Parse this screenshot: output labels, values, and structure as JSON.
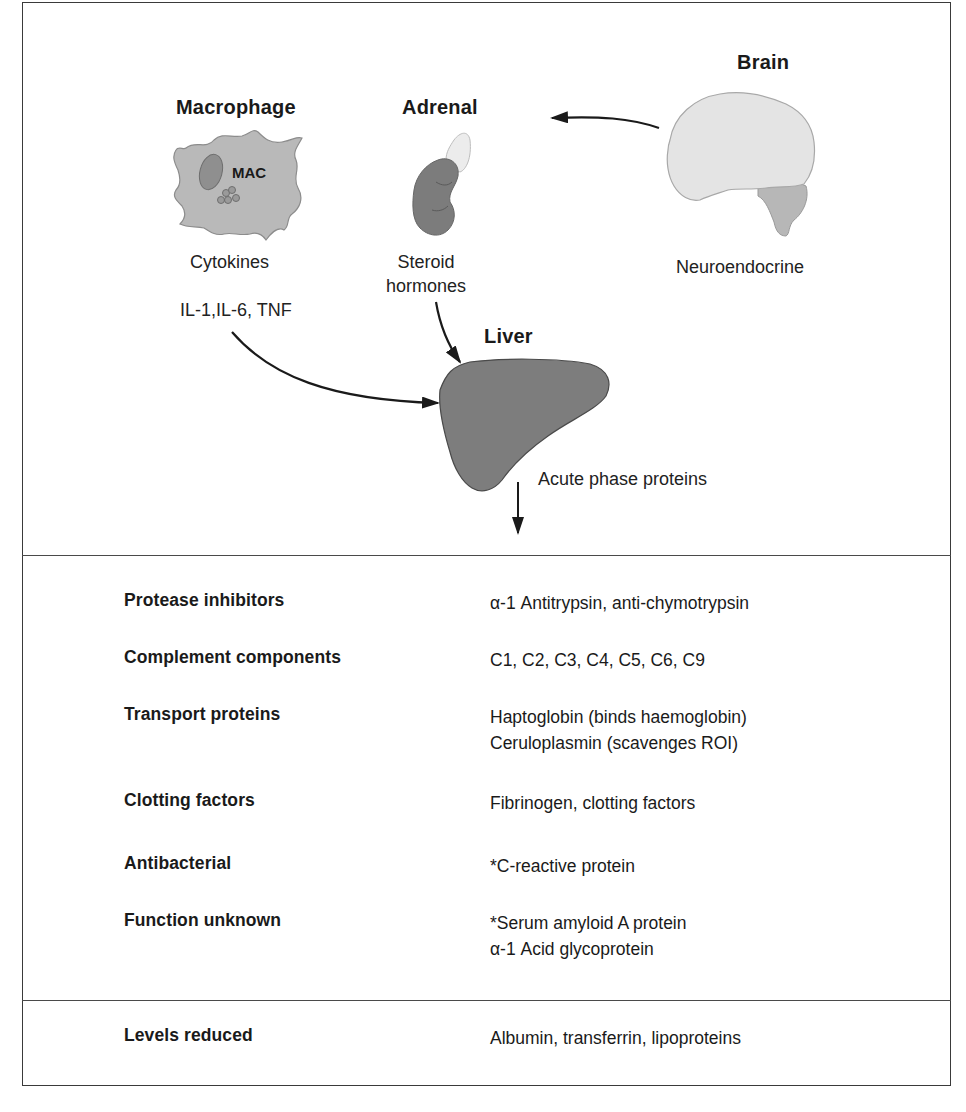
{
  "diagram": {
    "nodes": {
      "macrophage": {
        "title": "Macrophage",
        "cell_label": "MAC",
        "output": "Cytokines",
        "mediators": "IL-1,IL-6, TNF"
      },
      "adrenal": {
        "title": "Adrenal",
        "output_line1": "Steroid",
        "output_line2": "hormones"
      },
      "brain": {
        "title": "Brain",
        "output": "Neuroendocrine"
      },
      "liver": {
        "title": "Liver",
        "output": "Acute phase proteins"
      }
    },
    "edges": [
      {
        "from": "brain",
        "to": "adrenal"
      },
      {
        "from": "macrophage",
        "to": "liver"
      },
      {
        "from": "adrenal",
        "to": "liver"
      },
      {
        "from": "liver",
        "to": "acute-phase-proteins-table"
      }
    ],
    "colors": {
      "line": "#1a1a1a",
      "cell_fill": "#bdbdbd",
      "organ_dark": "#7a7a7a",
      "brain_fill": "#e4e4e4",
      "liver_fill": "#7d7d7d"
    }
  },
  "table": {
    "rows": [
      {
        "category": "Protease inhibitors",
        "proteins": [
          "α-1 Antitrypsin, anti-chymotrypsin"
        ]
      },
      {
        "category": "Complement components",
        "proteins": [
          "C1, C2, C3, C4, C5, C6, C9"
        ]
      },
      {
        "category": "Transport proteins",
        "proteins": [
          "Haptoglobin (binds haemoglobin)",
          "Ceruloplasmin (scavenges ROI)"
        ]
      },
      {
        "category": "Clotting factors",
        "proteins": [
          "Fibrinogen, clotting factors"
        ]
      },
      {
        "category": "Antibacterial",
        "proteins": [
          "*C-reactive protein"
        ]
      },
      {
        "category": "Function unknown",
        "proteins": [
          "*Serum amyloid A protein",
          "α-1 Acid glycoprotein"
        ]
      }
    ],
    "reduced": {
      "category": "Levels reduced",
      "proteins": [
        "Albumin, transferrin, lipoproteins"
      ]
    }
  }
}
